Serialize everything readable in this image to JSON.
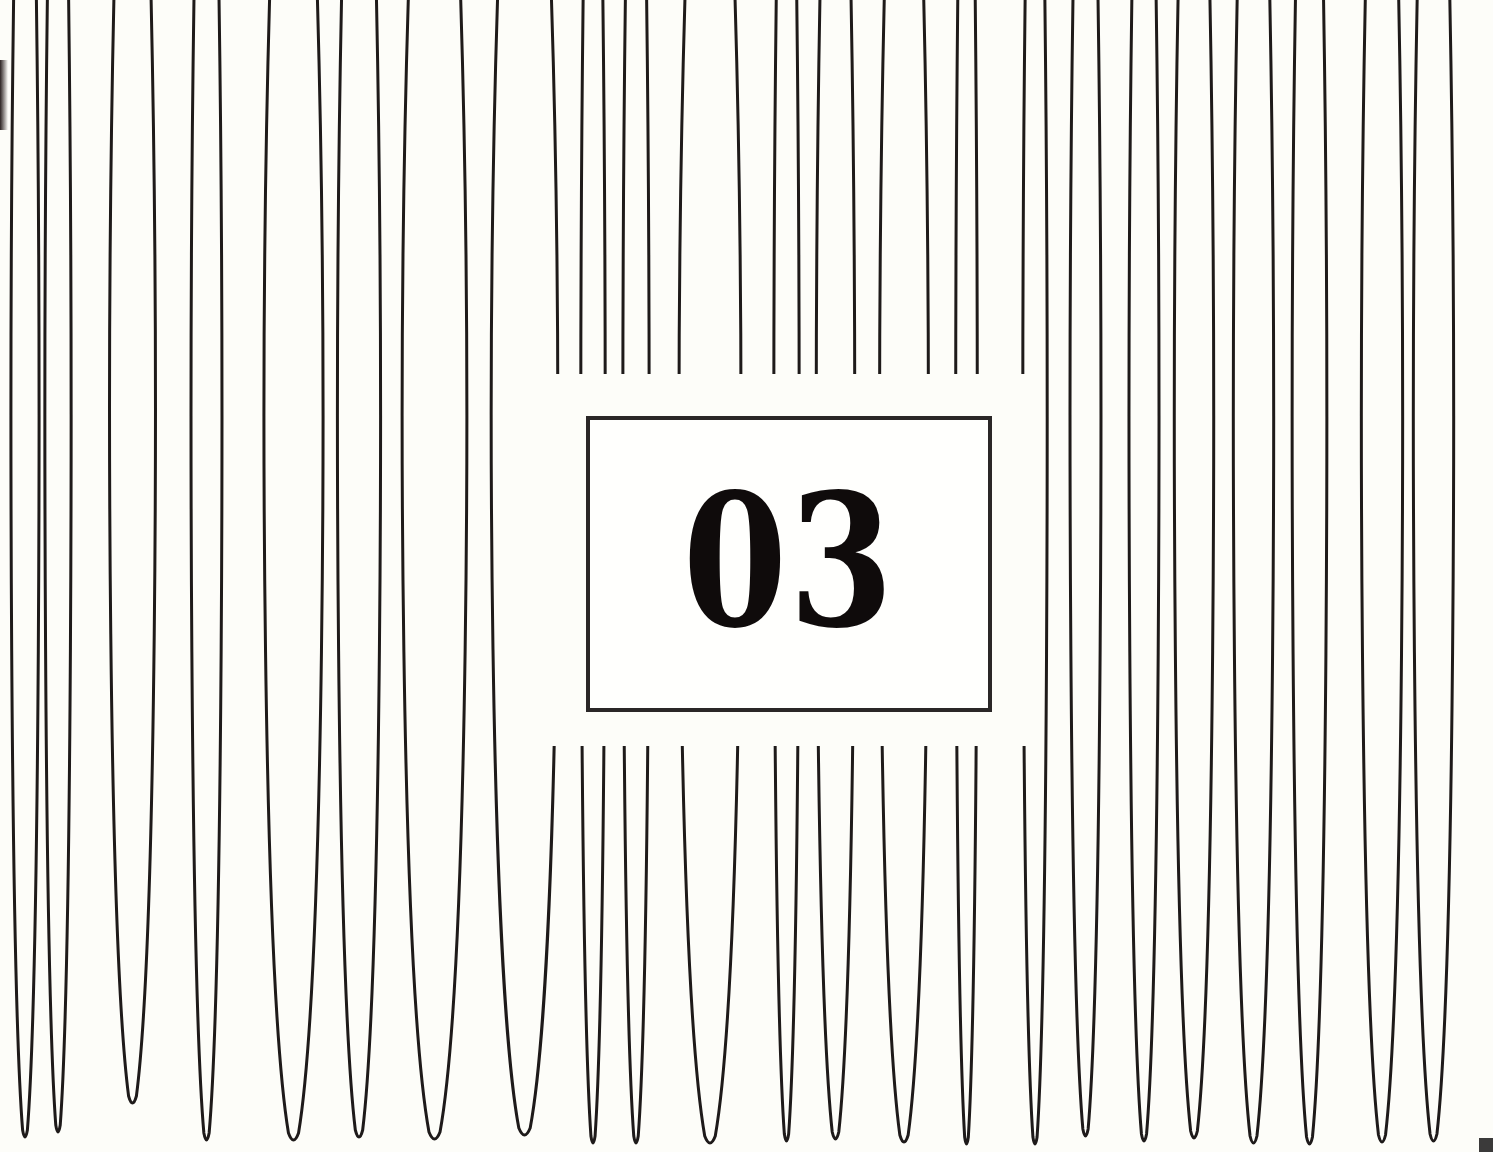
{
  "chapter": {
    "number": "03"
  },
  "colors": {
    "background": "#fdfdf9",
    "line": "#1e1a1a",
    "box_border": "#2a2727",
    "number": "#0f0b0b"
  },
  "loops": {
    "top_y": 0,
    "stroke_width": 3,
    "items": [
      {
        "l": 10,
        "r": 40,
        "bottom": 1138
      },
      {
        "l": 44,
        "r": 72,
        "bottom": 1133
      },
      {
        "l": 108,
        "r": 157,
        "bottom": 1104
      },
      {
        "l": 190,
        "r": 223,
        "bottom": 1141
      },
      {
        "l": 262,
        "r": 325,
        "bottom": 1141
      },
      {
        "l": 336,
        "r": 382,
        "bottom": 1138
      },
      {
        "l": 400,
        "r": 469,
        "bottom": 1140
      },
      {
        "l": 489,
        "r": 560,
        "bottom": 1136
      },
      {
        "l": 580,
        "r": 606,
        "bottom": 1144
      },
      {
        "l": 622,
        "r": 650,
        "bottom": 1144
      },
      {
        "l": 677,
        "r": 743,
        "bottom": 1144
      },
      {
        "l": 773,
        "r": 800,
        "bottom": 1142
      },
      {
        "l": 815,
        "r": 856,
        "bottom": 1140
      },
      {
        "l": 878,
        "r": 930,
        "bottom": 1143
      },
      {
        "l": 955,
        "r": 978,
        "bottom": 1145
      },
      {
        "l": 1022,
        "r": 1048,
        "bottom": 1145
      },
      {
        "l": 1069,
        "r": 1102,
        "bottom": 1137
      },
      {
        "l": 1128,
        "r": 1160,
        "bottom": 1142
      },
      {
        "l": 1173,
        "r": 1215,
        "bottom": 1139
      },
      {
        "l": 1232,
        "r": 1275,
        "bottom": 1144
      },
      {
        "l": 1291,
        "r": 1328,
        "bottom": 1145
      },
      {
        "l": 1360,
        "r": 1404,
        "bottom": 1143
      },
      {
        "l": 1412,
        "r": 1455,
        "bottom": 1142
      }
    ]
  },
  "gap": {
    "top": 374,
    "bottom": 746,
    "left": 548,
    "right": 1034
  }
}
